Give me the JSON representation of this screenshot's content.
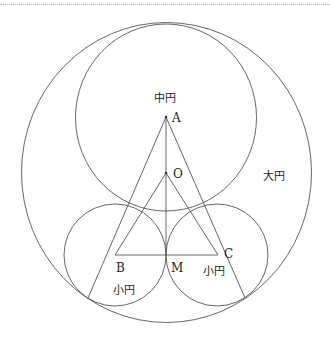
{
  "header": {
    "cut_text": "・・・"
  },
  "labels": {
    "A": "A",
    "O": "O",
    "B": "B",
    "C": "C",
    "M": "M",
    "medium_circle": "中円",
    "large_circle": "大円",
    "small_circle_left": "小円",
    "small_circle_right": "小円"
  },
  "geometry": {
    "large_circle": {
      "cx": 166.5,
      "cy": 172.5,
      "rx": 145,
      "ry": 150
    },
    "medium_circle": {
      "cx": 166,
      "cy": 117.5,
      "rx": 90.5,
      "ry": 93.5
    },
    "small_circle_left": {
      "cx": 115,
      "cy": 255,
      "r": 51
    },
    "small_circle_right": {
      "cx": 217,
      "cy": 255,
      "r": 51
    },
    "points": {
      "A": [
        166,
        117
      ],
      "O": [
        166,
        173
      ],
      "B": [
        115,
        255
      ],
      "C": [
        218,
        255
      ],
      "M": [
        166,
        255
      ],
      "P_left": [
        88,
        298
      ],
      "P_right": [
        245,
        298
      ]
    }
  },
  "colors": {
    "stroke": "#555555",
    "text": "#222222"
  }
}
